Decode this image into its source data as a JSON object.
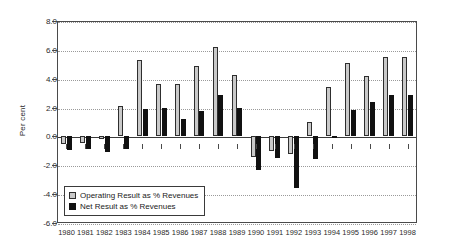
{
  "chart_data": {
    "type": "bar",
    "title": "",
    "xlabel": "",
    "ylabel": "Per cent",
    "ylim": [
      -6.0,
      8.0
    ],
    "yticks": [
      8.0,
      6.0,
      4.0,
      2.0,
      0.0,
      -2.0,
      -4.0,
      -6.0
    ],
    "ytick_labels": [
      "8.0",
      "6.0",
      "4.0",
      "2.0",
      "0.0",
      "-2.0",
      "-4.0",
      "-6.0"
    ],
    "grid": "horizontal-dotted",
    "legend_position": "inside-bottom-left",
    "categories": [
      "1980",
      "1981",
      "1982",
      "1983",
      "1984",
      "1985",
      "1986",
      "1987",
      "1988",
      "1989",
      "1990",
      "1991",
      "1992",
      "1993",
      "1994",
      "1995",
      "1996",
      "1997",
      "1998"
    ],
    "series": [
      {
        "name": "Operating Result as % Revenues",
        "color": "#c9c9c9",
        "values": [
          -0.5,
          -0.45,
          -0.15,
          2.1,
          5.3,
          3.6,
          3.65,
          4.85,
          6.2,
          4.25,
          -1.4,
          -1.0,
          -1.2,
          1.0,
          3.4,
          5.1,
          4.2,
          5.5,
          5.5
        ]
      },
      {
        "name": "Net Result as % Revenues",
        "color": "#111111",
        "values": [
          -0.95,
          -0.9,
          -1.1,
          -0.85,
          1.9,
          1.95,
          1.2,
          1.75,
          2.9,
          1.95,
          -2.3,
          -1.5,
          -3.6,
          -1.55,
          0.05,
          1.8,
          2.4,
          2.85,
          2.9
        ]
      }
    ]
  },
  "legend": {
    "items": [
      {
        "label": "Operating Result as % Revenues",
        "marker": "filled-square-light"
      },
      {
        "label": "Net Result as % Revenues",
        "marker": "filled-square-black"
      }
    ]
  }
}
